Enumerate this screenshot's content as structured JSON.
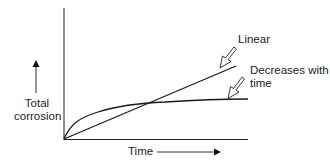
{
  "diagram": {
    "y_axis_label_line1": "Total",
    "y_axis_label_line2": "corrosion",
    "x_axis_label": "Time",
    "curves": [
      {
        "name": "linear",
        "label": "Linear"
      },
      {
        "name": "decreasing",
        "label_line1": "Decreases with",
        "label_line2": "time"
      }
    ],
    "colors": {
      "line": "#1a1a1a",
      "background": "#ffffff"
    }
  }
}
